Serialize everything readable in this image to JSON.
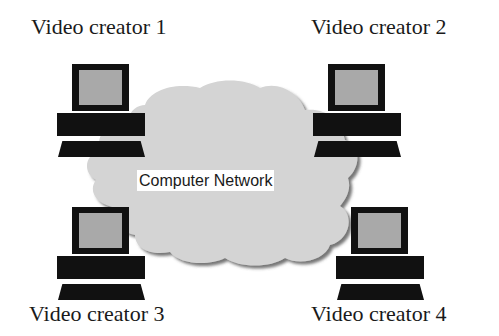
{
  "diagram": {
    "network": {
      "label": "Computer Network",
      "shape": "cloud",
      "fill_color": "#d4d4d4",
      "shadow_color": "#555555"
    },
    "nodes": [
      {
        "id": "creator-1",
        "label": "Video creator 1",
        "icon": "desktop-computer-icon",
        "position": "top-left"
      },
      {
        "id": "creator-2",
        "label": "Video creator 2",
        "icon": "desktop-computer-icon",
        "position": "top-right"
      },
      {
        "id": "creator-3",
        "label": "Video creator 3",
        "icon": "desktop-computer-icon",
        "position": "bottom-left"
      },
      {
        "id": "creator-4",
        "label": "Video creator 4",
        "icon": "desktop-computer-icon",
        "position": "bottom-right"
      }
    ],
    "colors": {
      "computer_body": "#111111",
      "screen": "#a9a9a9",
      "background": "#ffffff"
    }
  }
}
